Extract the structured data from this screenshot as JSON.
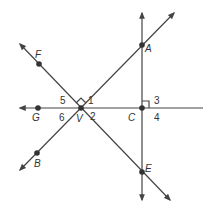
{
  "diagram": {
    "type": "geometry-lines-angles",
    "points": {
      "A": {
        "label": "A",
        "x": 142,
        "y": 45
      },
      "C": {
        "label": "C",
        "x": 142,
        "y": 108
      },
      "E": {
        "label": "E",
        "x": 142,
        "y": 172
      },
      "V": {
        "label": "V",
        "x": 81,
        "y": 108
      },
      "F": {
        "label": "F",
        "x": 39,
        "y": 64
      },
      "G": {
        "label": "G",
        "x": 38,
        "y": 108
      },
      "B": {
        "label": "B",
        "x": 37,
        "y": 153
      }
    },
    "angles": [
      "1",
      "2",
      "3",
      "4",
      "5",
      "6"
    ],
    "right_angle_marks": [
      "at V between VF and VA",
      "at C between CA and C-right"
    ],
    "line_color": "#444444"
  }
}
